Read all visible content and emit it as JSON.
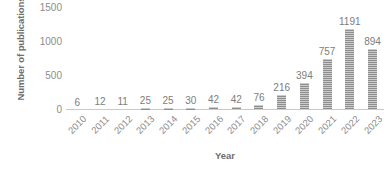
{
  "chart_data": {
    "type": "bar",
    "title": "",
    "subtitle": "",
    "xlabel": "Year",
    "ylabel": "Number of publications",
    "categories": [
      "2010",
      "2011",
      "2012",
      "2013",
      "2014",
      "2015",
      "2016",
      "2017",
      "2018",
      "2019",
      "2020",
      "2021",
      "2022",
      "2023"
    ],
    "values": [
      6,
      12,
      11,
      25,
      25,
      30,
      42,
      42,
      76,
      216,
      394,
      757,
      1191,
      894
    ],
    "data_labels": [
      "6",
      "12",
      "11",
      "25",
      "25",
      "30",
      "42",
      "42",
      "76",
      "216",
      "394",
      "757",
      "1191",
      "894"
    ],
    "ylim": [
      0,
      1500
    ],
    "y_ticks": [
      0,
      500,
      1000,
      1500
    ],
    "y_tick_labels": [
      "0",
      "500",
      "1000",
      "1500"
    ],
    "grid": false,
    "legend": "none",
    "bar_color": "#8e8e8e",
    "axis_text_color": "#8c8c8c",
    "axis_title_color": "#6e6e6e",
    "baseline_color": "#c9c9c9",
    "bar_fill_pattern": "horizontal-hatch",
    "x_tick_label_rotation": -45
  }
}
